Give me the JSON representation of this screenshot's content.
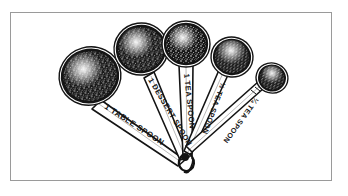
{
  "figure": {
    "style": "engraving",
    "background_color": "#ffffff",
    "ink_color": "#141414",
    "frame": {
      "border_color": "#9a9a9a",
      "border_width": 1,
      "fill": "#ffffff"
    }
  },
  "spoons": [
    {
      "id": "spoon-tablespoon",
      "label": "1 TABLE SPOON",
      "size_rank": 1,
      "bowl": {
        "cx": 90,
        "cy": 76,
        "rx": 29,
        "ry": 27,
        "rotation": -16
      },
      "handle": {
        "angle_deg": -57,
        "length": 96
      },
      "label_rotation": 33
    },
    {
      "id": "spoon-dessertspoon",
      "label": "1 DESSERT SPOON",
      "size_rank": 2,
      "bowl": {
        "cx": 141,
        "cy": 49,
        "rx": 25,
        "ry": 24,
        "rotation": -8
      },
      "handle": {
        "angle_deg": -74,
        "length": 100
      },
      "label_rotation": 59
    },
    {
      "id": "spoon-teaspoon",
      "label": "1 TEA SPOON",
      "size_rank": 3,
      "bowl": {
        "cx": 186,
        "cy": 44,
        "rx": 22,
        "ry": 21,
        "rotation": 0
      },
      "handle": {
        "angle_deg": -88,
        "length": 104
      },
      "label_rotation": 84
    },
    {
      "id": "spoon-half-teaspoon",
      "label": "½ TEA SPOON",
      "size_rank": 4,
      "bowl": {
        "cx": 232,
        "cy": 57,
        "rx": 19,
        "ry": 18,
        "rotation": 8
      },
      "handle": {
        "angle_deg": -103,
        "length": 100
      },
      "label_rotation": 110
    },
    {
      "id": "spoon-quarter-teaspoon",
      "label": "¼ TEA SPOON",
      "size_rank": 5,
      "bowl": {
        "cx": 272,
        "cy": 78,
        "rx": 14,
        "ry": 13,
        "rotation": 16
      },
      "handle": {
        "angle_deg": -118,
        "length": 92
      },
      "label_rotation": 126
    }
  ],
  "ring": {
    "id": "spoon-ring",
    "cx": 187,
    "cy": 163,
    "r": 7,
    "description": "split ring / clip joining the five handles"
  }
}
